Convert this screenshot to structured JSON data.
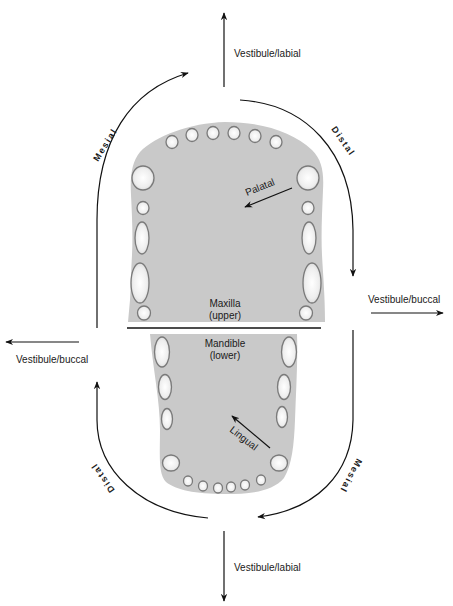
{
  "diagram": {
    "jaws": {
      "upper": {
        "name": "Maxilla",
        "sub": "(upper)"
      },
      "lower": {
        "name": "Mandible",
        "sub": "(lower)"
      }
    },
    "directions": {
      "top": "Vestibule/labial",
      "bottom": "Vestibule/labial",
      "left": "Vestibule/buccal",
      "right": "Vestibule/buccal",
      "palatal": "Palatal",
      "lingual": "Lingual"
    },
    "arcs": {
      "upper_left": "Mesial",
      "upper_right": "Distal",
      "lower_left": "Distal",
      "lower_right": "Mesial"
    },
    "colors": {
      "jaw_fill": "#c9c9c9",
      "tooth_outline": "#7a7a7a",
      "line": "#111111"
    }
  }
}
